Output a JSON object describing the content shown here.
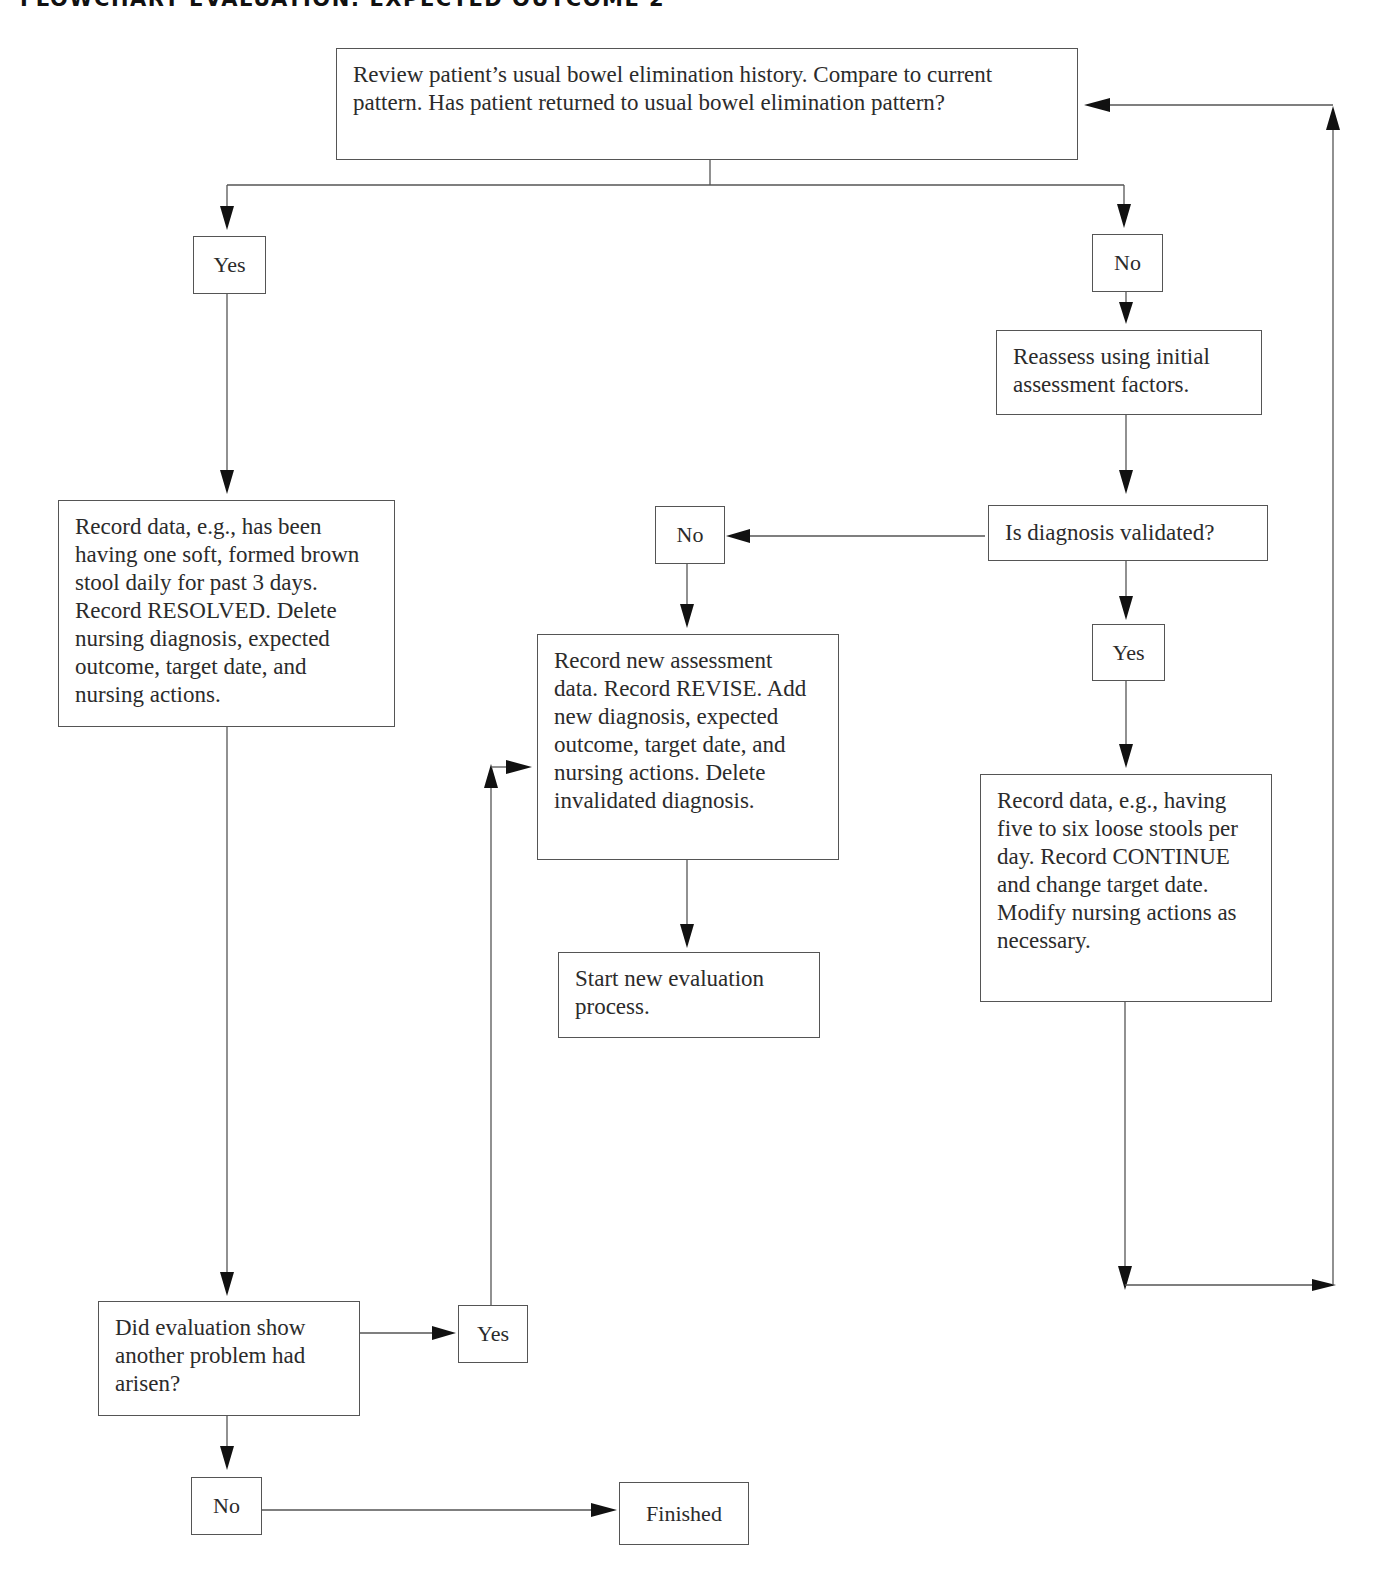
{
  "header": {
    "title": "FLOWCHART EVALUATION: EXPECTED OUTCOME 2"
  },
  "nodes": {
    "review": "Review patient’s usual bowel elimination history. Compare to current pattern. Has patient returned to usual bowel elimination pattern?",
    "yes_top": "Yes",
    "no_top": "No",
    "reassess": "Reassess using initial assessment factors.",
    "validated_question": "Is diagnosis validated?",
    "no_middle": "No",
    "yes_right": "Yes",
    "record_resolved": "Record data, e.g., has been having one soft, formed brown stool daily for past 3 days. Record RESOLVED. Delete nursing diagnosis, expected outcome, target date, and nursing actions.",
    "record_revise": "Record new assessment data. Record REVISE. Add new diagnosis, expected outcome, target date, and nursing actions. Delete invalidated diagnosis.",
    "record_continue": "Record data, e.g., having five to six loose stools per day. Record CONTINUE and change target date. Modify nursing actions as necessary.",
    "start_new": "Start new evaluation process.",
    "another_problem": "Did evaluation show another problem had arisen?",
    "yes_bottom": "Yes",
    "no_bottom": "No",
    "finished": "Finished"
  },
  "connections": [
    {
      "from": "review",
      "to": "yes_top"
    },
    {
      "from": "review",
      "to": "no_top"
    },
    {
      "from": "no_top",
      "to": "reassess"
    },
    {
      "from": "reassess",
      "to": "validated_question"
    },
    {
      "from": "validated_question",
      "to": "no_middle"
    },
    {
      "from": "validated_question",
      "to": "yes_right"
    },
    {
      "from": "no_middle",
      "to": "record_revise"
    },
    {
      "from": "record_revise",
      "to": "start_new"
    },
    {
      "from": "yes_right",
      "to": "record_continue"
    },
    {
      "from": "record_continue",
      "to": "review"
    },
    {
      "from": "yes_top",
      "to": "record_resolved"
    },
    {
      "from": "record_resolved",
      "to": "another_problem"
    },
    {
      "from": "another_problem",
      "to": "yes_bottom"
    },
    {
      "from": "yes_bottom",
      "to": "record_revise"
    },
    {
      "from": "another_problem",
      "to": "no_bottom"
    },
    {
      "from": "no_bottom",
      "to": "finished"
    }
  ]
}
